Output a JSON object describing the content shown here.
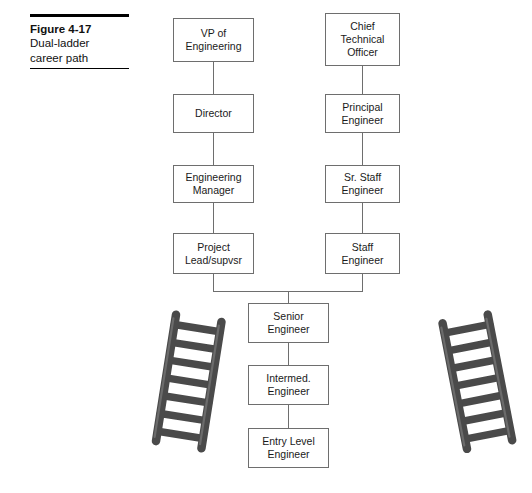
{
  "figure": {
    "caption": {
      "title": "Figure 4-17",
      "line2": "Dual-ladder",
      "line3": "career path"
    },
    "colors": {
      "box_border": "#6e6e6e",
      "connector": "#6e6e6e",
      "ladder_fill": "#4a4a4a",
      "ladder_highlight": "#6b6b6b",
      "rule": "#000000",
      "text": "#1a1a1a",
      "background": "#ffffff"
    },
    "management_ladder": {
      "name": "management-ladder",
      "nodes": [
        {
          "label": "VP of\nEngineering"
        },
        {
          "label": "Director"
        },
        {
          "label": "Engineering\nManager"
        },
        {
          "label": "Project\nLead/supvsr"
        }
      ]
    },
    "technical_ladder": {
      "name": "technical-ladder",
      "nodes": [
        {
          "label": "Chief\nTechnical\nOfficer"
        },
        {
          "label": "Principal\nEngineer"
        },
        {
          "label": "Sr. Staff\nEngineer"
        },
        {
          "label": "Staff\nEngineer"
        }
      ]
    },
    "common_track": {
      "name": "common-track",
      "nodes": [
        {
          "label": "Senior\nEngineer"
        },
        {
          "label": "Intermed.\nEngineer"
        },
        {
          "label": "Entry Level\nEngineer"
        }
      ]
    },
    "decorations": {
      "left_ladder_icon": "ladder-icon",
      "right_ladder_icon": "ladder-icon",
      "rung_count": 7
    }
  }
}
